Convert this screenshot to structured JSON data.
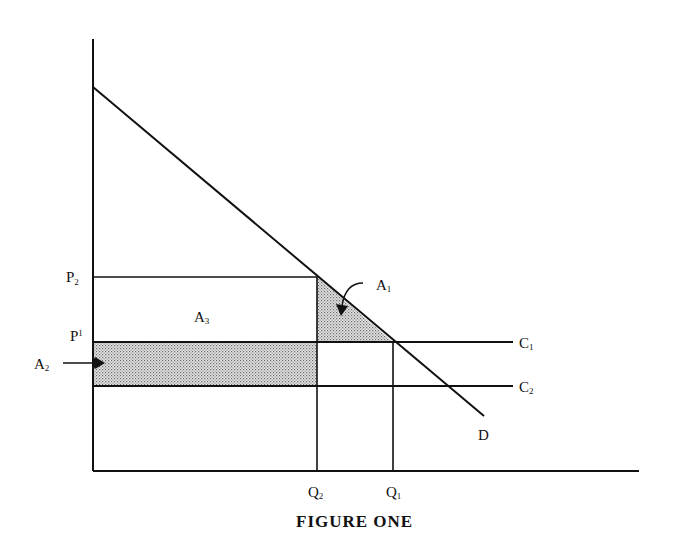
{
  "diagram": {
    "caption": "FIGURE ONE",
    "curves": [
      {
        "id": "D",
        "label": "D",
        "description": "downward-sloping demand curve"
      },
      {
        "id": "C1",
        "label": "C",
        "subscript": "1",
        "description": "higher horizontal cost line"
      },
      {
        "id": "C2",
        "label": "C",
        "subscript": "2",
        "description": "lower horizontal cost line"
      }
    ],
    "y_axis_labels": [
      {
        "label": "P",
        "subscript": "2"
      },
      {
        "label": "P",
        "subscript": "1"
      }
    ],
    "x_axis_labels": [
      {
        "label": "Q",
        "subscript": "2"
      },
      {
        "label": "Q",
        "subscript": "1"
      }
    ],
    "areas": [
      {
        "label": "A",
        "subscript": "1",
        "description": "shaded triangle between P2, C1, Q2 and demand curve"
      },
      {
        "label": "A",
        "subscript": "2",
        "description": "shaded rectangle between C1 and C2 from 0 to Q2"
      },
      {
        "label": "A",
        "subscript": "3",
        "description": "unshaded rectangle between P2 and C1 from 0 to Q2"
      }
    ],
    "colors": {
      "ink": "#111111",
      "shade": "#bdbdbd",
      "background": "#ffffff"
    }
  }
}
